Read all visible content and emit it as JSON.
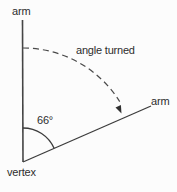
{
  "diagram": {
    "labels": {
      "arm_top": "arm",
      "arm_right": "arm",
      "vertex": "vertex",
      "angle_turned": "angle turned",
      "angle_value": "66°"
    },
    "angle_degrees": 66,
    "colors": {
      "line": "#454545",
      "text": "#2d2d2d",
      "background": "#fcfcfc"
    }
  }
}
